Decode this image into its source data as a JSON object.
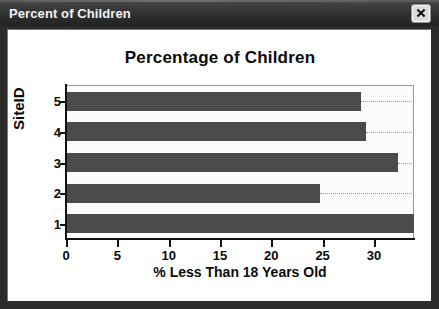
{
  "window": {
    "title": "Percent of Children",
    "close_icon": "close-x-icon"
  },
  "chart_data": {
    "type": "bar",
    "orientation": "horizontal",
    "title": "Percentage of Children",
    "xlabel": "% Less Than 18 Years Old",
    "ylabel": "SiteID",
    "categories": [
      "1",
      "2",
      "3",
      "4",
      "5"
    ],
    "values": [
      33.9,
      24.7,
      32.3,
      29.2,
      28.7
    ],
    "xlim": [
      0,
      33.9
    ],
    "ylim": [
      0.4,
      5.6
    ],
    "xticks": [
      "0",
      "5",
      "10",
      "15",
      "20",
      "25",
      "30"
    ],
    "xtick_values": [
      0,
      5,
      10,
      15,
      20,
      25,
      30
    ],
    "yticks": [
      "1",
      "2",
      "3",
      "4",
      "5"
    ],
    "grid": "horizontal-dotted",
    "legend": "none",
    "bar_color": "#4b4b4b",
    "plot_background": "#fbfbfb"
  }
}
